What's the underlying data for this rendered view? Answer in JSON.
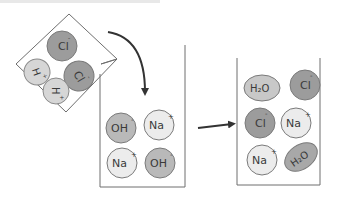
{
  "diagram": {
    "title_fragment": "",
    "colors": {
      "beaker_stroke": "#6e6e6e",
      "arrow": "#333333",
      "cl_fill": "#9c9c9c",
      "oh_fill": "#b9b9b9",
      "na_fill": "#ececec",
      "h_fill": "#d6d6d6",
      "h2o_fill": "#c8c8c8",
      "ion_stroke": "#7a7a7a"
    },
    "tilted_beaker": {
      "label": "HCl solution",
      "ions": [
        {
          "symbol": "Cl",
          "charge": "-",
          "type": "cl"
        },
        {
          "symbol": "Cl",
          "charge": "-",
          "type": "cl"
        },
        {
          "symbol": "H",
          "charge": "+",
          "type": "h"
        },
        {
          "symbol": "H",
          "charge": "+",
          "type": "h"
        }
      ]
    },
    "middle_beaker": {
      "label": "NaOH solution",
      "ions": [
        {
          "symbol": "OH",
          "charge": "-",
          "type": "oh"
        },
        {
          "symbol": "Na",
          "charge": "+",
          "type": "na"
        },
        {
          "symbol": "Na",
          "charge": "+",
          "type": "na"
        },
        {
          "symbol": "OH",
          "charge": "-",
          "type": "oh"
        }
      ]
    },
    "right_beaker": {
      "label": "Products",
      "ions": [
        {
          "symbol": "H₂O",
          "charge": "",
          "type": "h2o"
        },
        {
          "symbol": "Cl",
          "charge": "-",
          "type": "cl"
        },
        {
          "symbol": "Cl",
          "charge": "-",
          "type": "cl"
        },
        {
          "symbol": "Na",
          "charge": "+",
          "type": "na"
        },
        {
          "symbol": "Na",
          "charge": "+",
          "type": "na"
        },
        {
          "symbol": "H₂O",
          "charge": "",
          "type": "h2o"
        }
      ]
    },
    "arrows": [
      {
        "from": "tilted_beaker",
        "to": "middle_beaker",
        "style": "curved"
      },
      {
        "from": "middle_beaker",
        "to": "right_beaker",
        "style": "straight"
      }
    ]
  }
}
